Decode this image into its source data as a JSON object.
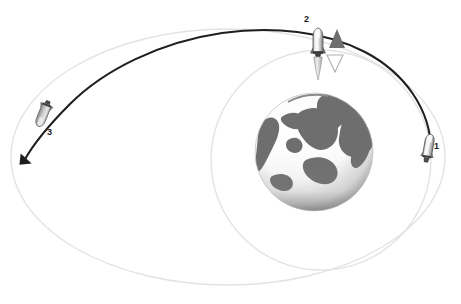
{
  "figure": {
    "background_color": "#ffffff"
  },
  "labels": {
    "burn1": "1",
    "burn2": "2",
    "burn3": "3"
  },
  "colors": {
    "transfer_orbit": "#1f1f1f",
    "low_orbit": "#e2e2e2",
    "target_orbit": "#e2e2e2",
    "rocket_body_light": "#f2f2f2",
    "rocket_body_mid": "#b9b9b9",
    "rocket_body_dark": "#6a6a6a",
    "rocket_outline": "#4a4a4a",
    "thrust_triangle_fill": "#6e6e6e",
    "thrust_triangle_outline": "#9a9a9a",
    "earth_land": "#6e6e6e",
    "earth_ocean": "#f4f4f4",
    "earth_shadow": "#8c8c8c",
    "arrow": "#1f1f1f"
  },
  "elements": {
    "earth": {
      "name": "Earth",
      "center_x": 314,
      "center_y": 152,
      "radius": 59
    },
    "low_orbit": {
      "name": "Circular parking orbit",
      "center_x": 321,
      "center_y": 160,
      "rx": 109,
      "ry": 110
    },
    "target_orbit": {
      "name": "Outer target orbit",
      "center_x": 228,
      "center_y": 157,
      "rx": 217,
      "ry": 128
    },
    "transfer_orbit": {
      "name": "Elliptical transfer orbit arc",
      "start_x": 431,
      "start_y": 150,
      "end_x": 23,
      "end_y": 163
    },
    "rocket1": {
      "name": "Spacecraft at first burn",
      "x": 428,
      "y": 148,
      "rotation": 8
    },
    "rocket2": {
      "name": "Spacecraft at second burn",
      "x": 318,
      "y": 45,
      "rotation": 0
    },
    "rocket3": {
      "name": "Spacecraft at third burn",
      "x": 44,
      "y": 112,
      "rotation": 205
    },
    "thrust_up_triangle": {
      "name": "Prograde thrust vector",
      "x": 337,
      "y": 41
    },
    "thrust_down_triangle": {
      "name": "Retrograde thrust vector",
      "x": 335,
      "y": 64
    },
    "direction_arrow": {
      "name": "Orbit direction arrow",
      "x": 23,
      "y": 163
    }
  }
}
